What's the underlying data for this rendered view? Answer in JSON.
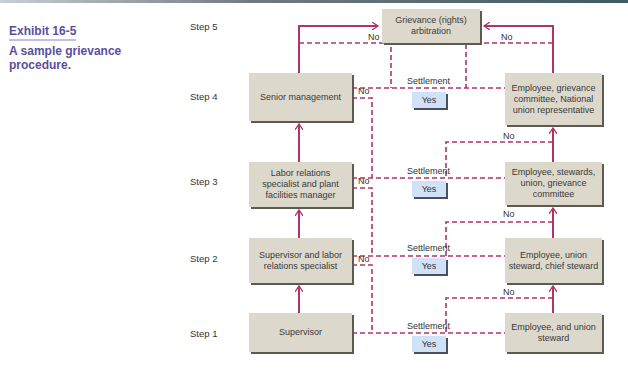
{
  "exhibit": {
    "number": "Exhibit 16-5",
    "caption": "A sample grievance procedure."
  },
  "steps": [
    "Step 5",
    "Step 4",
    "Step 3",
    "Step 2",
    "Step 1"
  ],
  "boxes": {
    "arbitration": "Grievance (rights) arbitration",
    "management": [
      "Senior management",
      "Labor relations specialist and plant facilities manager",
      "Supervisor and labor relations specialist",
      "Supervisor"
    ],
    "union": [
      "Employee, grievance committee, National union representative",
      "Employee, stewards, union, grievance committee",
      "Employee, union steward, chief steward",
      "Employee, and union steward"
    ]
  },
  "labels": {
    "settlement": "Settlement",
    "yes": "Yes",
    "no": "No"
  },
  "colors": {
    "title": "#5a4f9c",
    "arrow": "#b0336b",
    "box": "#ddd8cc",
    "yes_box": "#cfe2f7"
  }
}
